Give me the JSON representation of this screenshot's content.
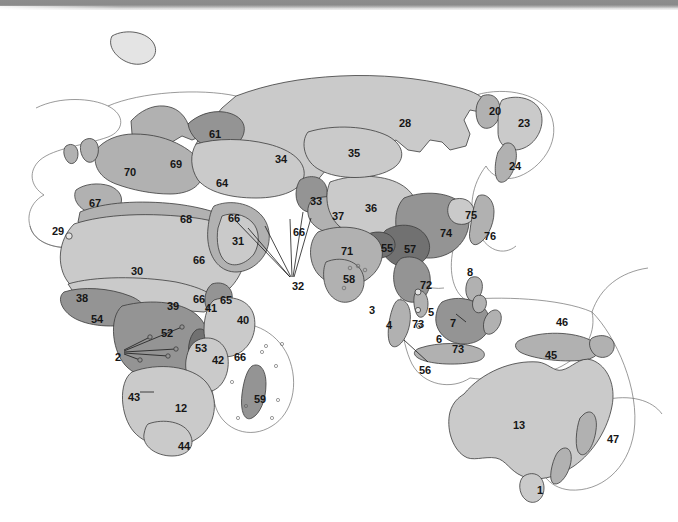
{
  "figure": {
    "type": "map",
    "projection_note": "world map, eastern hemisphere",
    "background_color": "#ffffff",
    "outline_color": "#3a3a3a",
    "scan_edge_color": "#8d8d8d"
  },
  "palette": {
    "water": "#ffffff",
    "tone_lightest": "#e2e2e2",
    "tone_light": "#c9c9c9",
    "tone_mid": "#b0b0b0",
    "tone_dark": "#8e8e8e",
    "tone_darkest": "#6f6f6f",
    "label_color": "#161616"
  },
  "labels": [
    {
      "id": "l1",
      "text": "1",
      "x": 537,
      "y": 485,
      "size": "md",
      "region": "tasmania"
    },
    {
      "id": "l2",
      "text": "2",
      "x": 115,
      "y": 352,
      "size": "md",
      "region": "gulf-of-guinea-islands"
    },
    {
      "id": "l3",
      "text": "3",
      "x": 369,
      "y": 305,
      "size": "md",
      "region": "sri-lanka"
    },
    {
      "id": "l4",
      "text": "4",
      "x": 386,
      "y": 320,
      "size": "md",
      "region": "indian-ocean"
    },
    {
      "id": "l5",
      "text": "5",
      "x": 428,
      "y": 307,
      "size": "md",
      "region": "malay-peninsula"
    },
    {
      "id": "l6",
      "text": "6",
      "x": 436,
      "y": 334,
      "size": "md",
      "region": "java"
    },
    {
      "id": "l7",
      "text": "7",
      "x": 450,
      "y": 318,
      "size": "md",
      "region": "borneo"
    },
    {
      "id": "l8",
      "text": "8",
      "x": 467,
      "y": 267,
      "size": "md",
      "region": "philippines"
    },
    {
      "id": "l12",
      "text": "12",
      "x": 175,
      "y": 403,
      "size": "md",
      "region": "southern-africa"
    },
    {
      "id": "l13",
      "text": "13",
      "x": 513,
      "y": 420,
      "size": "md",
      "region": "australia"
    },
    {
      "id": "l20",
      "text": "20",
      "x": 489,
      "y": 106,
      "size": "md",
      "region": "kamchatka"
    },
    {
      "id": "l23",
      "text": "23",
      "x": 518,
      "y": 118,
      "size": "md",
      "region": "sea-of-okhotsk"
    },
    {
      "id": "l24",
      "text": "24",
      "x": 509,
      "y": 161,
      "size": "md",
      "region": "sakhalin"
    },
    {
      "id": "l28",
      "text": "28",
      "x": 399,
      "y": 118,
      "size": "md",
      "region": "siberia"
    },
    {
      "id": "l29",
      "text": "29",
      "x": 52,
      "y": 226,
      "size": "md",
      "region": "azores"
    },
    {
      "id": "l30",
      "text": "30",
      "x": 131,
      "y": 266,
      "size": "md",
      "region": "sahara"
    },
    {
      "id": "l31",
      "text": "31",
      "x": 232,
      "y": 236,
      "size": "md",
      "region": "arabian-peninsula"
    },
    {
      "id": "l32",
      "text": "32",
      "x": 292,
      "y": 281,
      "size": "md",
      "region": "middle-east-islands"
    },
    {
      "id": "l33",
      "text": "33",
      "x": 310,
      "y": 196,
      "size": "md",
      "region": "central-asia-highland"
    },
    {
      "id": "l34",
      "text": "34",
      "x": 275,
      "y": 154,
      "size": "md",
      "region": "west-siberia"
    },
    {
      "id": "l35",
      "text": "35",
      "x": 348,
      "y": 148,
      "size": "md",
      "region": "central-siberia"
    },
    {
      "id": "l36",
      "text": "36",
      "x": 365,
      "y": 203,
      "size": "md",
      "region": "mongolia"
    },
    {
      "id": "l37",
      "text": "37",
      "x": 332,
      "y": 211,
      "size": "md",
      "region": "tibetan-plateau"
    },
    {
      "id": "l38",
      "text": "38",
      "x": 76,
      "y": 293,
      "size": "md",
      "region": "west-african-coast"
    },
    {
      "id": "l39",
      "text": "39",
      "x": 167,
      "y": 301,
      "size": "md",
      "region": "sahel"
    },
    {
      "id": "l40",
      "text": "40",
      "x": 237,
      "y": 315,
      "size": "md",
      "region": "east-africa"
    },
    {
      "id": "l41",
      "text": "41",
      "x": 205,
      "y": 303,
      "size": "md",
      "region": "ethiopian-highlands"
    },
    {
      "id": "l42",
      "text": "42",
      "x": 212,
      "y": 355,
      "size": "md",
      "region": "mozambique"
    },
    {
      "id": "l43",
      "text": "43",
      "x": 128,
      "y": 392,
      "size": "md",
      "region": "angola-coast"
    },
    {
      "id": "l44",
      "text": "44",
      "x": 178,
      "y": 441,
      "size": "md",
      "region": "cape-region"
    },
    {
      "id": "l45",
      "text": "45",
      "x": 545,
      "y": 350,
      "size": "md",
      "region": "new-guinea"
    },
    {
      "id": "l46",
      "text": "46",
      "x": 556,
      "y": 317,
      "size": "md",
      "region": "western-pacific"
    },
    {
      "id": "l47",
      "text": "47",
      "x": 607,
      "y": 434,
      "size": "md",
      "region": "new-zealand"
    },
    {
      "id": "l52",
      "text": "52",
      "x": 161,
      "y": 328,
      "size": "md",
      "region": "congo-basin"
    },
    {
      "id": "l53",
      "text": "53",
      "x": 195,
      "y": 343,
      "size": "md",
      "region": "albertine-rift"
    },
    {
      "id": "l54",
      "text": "54",
      "x": 91,
      "y": 314,
      "size": "md",
      "region": "upper-guinea"
    },
    {
      "id": "l55",
      "text": "55",
      "x": 381,
      "y": 243,
      "size": "md",
      "region": "himalaya"
    },
    {
      "id": "l56",
      "text": "56",
      "x": 419,
      "y": 365,
      "size": "md",
      "region": "sumatra"
    },
    {
      "id": "l57",
      "text": "57",
      "x": 404,
      "y": 244,
      "size": "md",
      "region": "south-china"
    },
    {
      "id": "l58",
      "text": "58",
      "x": 343,
      "y": 274,
      "size": "md",
      "region": "deccan"
    },
    {
      "id": "l59",
      "text": "59",
      "x": 254,
      "y": 394,
      "size": "md",
      "region": "madagascar"
    },
    {
      "id": "l61",
      "text": "61",
      "x": 209,
      "y": 129,
      "size": "md",
      "region": "white-sea"
    },
    {
      "id": "l64",
      "text": "64",
      "x": 216,
      "y": 178,
      "size": "md",
      "region": "caucasus"
    },
    {
      "id": "l65",
      "text": "65",
      "x": 220,
      "y": 295,
      "size": "md",
      "region": "horn-of-africa"
    },
    {
      "id": "l66a",
      "text": "66",
      "x": 193,
      "y": 294,
      "size": "md",
      "region": "island-marker-guinea"
    },
    {
      "id": "l66b",
      "text": "66",
      "x": 228,
      "y": 213,
      "size": "md",
      "region": "island-marker-levant"
    },
    {
      "id": "l66c",
      "text": "66",
      "x": 193,
      "y": 255,
      "size": "md",
      "region": "island-marker-red-sea"
    },
    {
      "id": "l66d",
      "text": "66",
      "x": 293,
      "y": 227,
      "size": "md",
      "region": "island-marker-persian-gulf"
    },
    {
      "id": "l66e",
      "text": "66",
      "x": 234,
      "y": 352,
      "size": "md",
      "region": "island-marker-comoros"
    },
    {
      "id": "l67",
      "text": "67",
      "x": 89,
      "y": 198,
      "size": "md",
      "region": "iberia"
    },
    {
      "id": "l68",
      "text": "68",
      "x": 180,
      "y": 214,
      "size": "md",
      "region": "mediterranean"
    },
    {
      "id": "l69",
      "text": "69",
      "x": 170,
      "y": 159,
      "size": "md",
      "region": "eastern-europe"
    },
    {
      "id": "l70",
      "text": "70",
      "x": 124,
      "y": 167,
      "size": "md",
      "region": "western-europe"
    },
    {
      "id": "l71",
      "text": "71",
      "x": 341,
      "y": 246,
      "size": "md",
      "region": "indo-gangetic-plain"
    },
    {
      "id": "l72",
      "text": "72",
      "x": 420,
      "y": 280,
      "size": "md",
      "region": "indochina"
    },
    {
      "id": "l73a",
      "text": "73",
      "x": 412,
      "y": 319,
      "size": "md",
      "region": "sumatra-north"
    },
    {
      "id": "l73b",
      "text": "73",
      "x": 452,
      "y": 344,
      "size": "md",
      "region": "lesser-sundas"
    },
    {
      "id": "l74",
      "text": "74",
      "x": 440,
      "y": 228,
      "size": "md",
      "region": "east-china"
    },
    {
      "id": "l75",
      "text": "75",
      "x": 465,
      "y": 210,
      "size": "md",
      "region": "korea"
    },
    {
      "id": "l76",
      "text": "76",
      "x": 484,
      "y": 231,
      "size": "md",
      "region": "japan"
    }
  ],
  "leader_lines": {
    "name": "pointer-lines",
    "count": 7,
    "description": "thin black leader lines from numbers 2, 32, 43, 56, 7 to small island features"
  }
}
